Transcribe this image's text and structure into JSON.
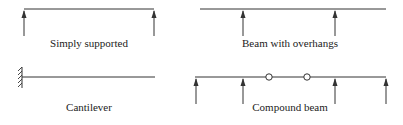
{
  "diagrams": [
    {
      "label": "Simply supported",
      "type": "simply-supported",
      "beam": {
        "x1": 24,
        "x2": 154,
        "y": 9
      },
      "supports_x": [
        24,
        154
      ],
      "label_pos": {
        "x": 89,
        "y": 47
      }
    },
    {
      "label": "Beam with overhangs",
      "type": "overhang",
      "beam": {
        "x1": 200,
        "x2": 386,
        "y": 9
      },
      "supports_x": [
        243,
        335
      ],
      "label_pos": {
        "x": 290,
        "y": 47
      }
    },
    {
      "label": "Cantilever",
      "type": "cantilever",
      "beam": {
        "x1": 24,
        "x2": 155,
        "y": 77
      },
      "wall_x": 22,
      "label_pos": {
        "x": 89,
        "y": 111
      }
    },
    {
      "label": "Compound beam",
      "type": "compound",
      "beam": {
        "x1": 195,
        "x2": 386,
        "y": 77
      },
      "supports_x": [
        196,
        243,
        335,
        386
      ],
      "hinges_x": [
        269,
        307
      ],
      "label_pos": {
        "x": 290,
        "y": 111
      }
    }
  ],
  "colors": {
    "line": "#333333",
    "text": "#222222",
    "background": "#ffffff"
  }
}
